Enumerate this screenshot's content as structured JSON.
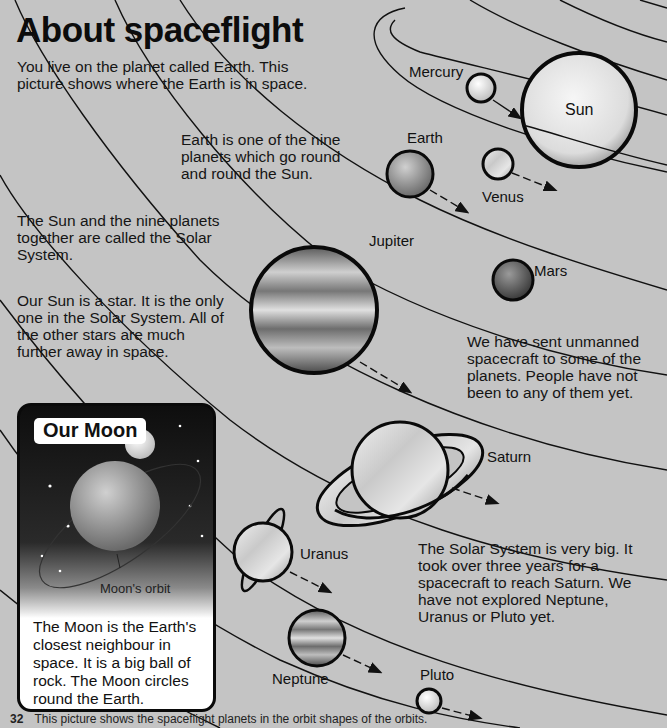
{
  "title": "About spaceflight",
  "paragraphs": {
    "intro": "You live on the planet called Earth. This picture shows where the Earth is in space.",
    "earth": "Earth is one of the nine planets which go round and round the Sun.",
    "solar_system": "The Sun and the nine planets together are called the Solar System.",
    "star": "Our Sun is a star. It is the only one in the Solar System. All of the other stars are much further away in space.",
    "unmanned": "We have sent unmanned spacecraft to some of the planets. People have not been to any of them yet.",
    "big": "The Solar System is very big. It took over three years for a spacecraft to reach Saturn. We have not explored Neptune, Uranus or Pluto yet."
  },
  "planet_labels": {
    "sun": "Sun",
    "mercury": "Mercury",
    "venus": "Venus",
    "earth": "Earth",
    "mars": "Mars",
    "jupiter": "Jupiter",
    "saturn": "Saturn",
    "uranus": "Uranus",
    "neptune": "Neptune",
    "pluto": "Pluto"
  },
  "moon_panel": {
    "title": "Our Moon",
    "orbit_label": "Moon's orbit",
    "description": "The Moon is the Earth's closest neighbour in space. It is a big ball of rock. The Moon circles round the Earth."
  },
  "footer": {
    "page_number": "32",
    "caption": "This picture shows the spaceflight planets in the orbit shapes of the orbits."
  }
}
